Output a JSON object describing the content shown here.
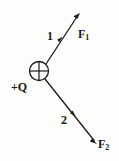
{
  "figure": {
    "background_color": "#fdfdfc",
    "ink_color": "#1a1a1a",
    "width": 119,
    "height": 161
  },
  "charge": {
    "label": "+Q",
    "symbol_name": "circled-plus",
    "center_x": 39,
    "center_y": 71,
    "radius": 10
  },
  "vectors": [
    {
      "id": "vector-1",
      "number_label": "1",
      "force_label": "F",
      "force_subscript": "1",
      "from_x": 46,
      "from_y": 64,
      "to_x": 80,
      "to_y": 13,
      "direction": "up-right",
      "mid_marker_x": 60,
      "mid_marker_y": 40
    },
    {
      "id": "vector-2",
      "number_label": "2",
      "force_label": "F",
      "force_subscript": "2",
      "from_x": 45,
      "from_y": 79,
      "to_x": 97,
      "to_y": 144,
      "direction": "down-right",
      "mid_marker_x": 73,
      "mid_marker_y": 113
    }
  ]
}
